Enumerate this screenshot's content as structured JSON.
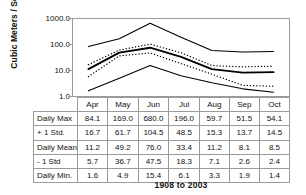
{
  "chart_data": {
    "type": "line",
    "title": "",
    "subtitle": "",
    "footer": "1908 to 2003",
    "xlabel": "",
    "ylabel": "Cubic Meters / Second",
    "yscale": "log",
    "ylim": [
      1.0,
      1000.0
    ],
    "ytick_labels": [
      "1000.0",
      "100.0",
      "10.0",
      "1.0"
    ],
    "ytick_values": [
      1000.0,
      100.0,
      10.0,
      1.0
    ],
    "grid": false,
    "legend": "none",
    "categories": [
      "Apr",
      "May",
      "Jun",
      "Jul",
      "Aug",
      "Sep",
      "Oct"
    ],
    "series": [
      {
        "name": "Daily Max",
        "style": "solid",
        "values": [
          84.1,
          169.0,
          680.0,
          196.0,
          59.7,
          51.5,
          54.1
        ]
      },
      {
        "name": "+ 1 Std.",
        "style": "dotted",
        "values": [
          16.7,
          61.7,
          104.5,
          48.5,
          15.3,
          13.7,
          14.5
        ]
      },
      {
        "name": "Daily Mean",
        "style": "solid-thick",
        "values": [
          11.2,
          49.2,
          76.0,
          33.4,
          11.2,
          8.1,
          8.5
        ]
      },
      {
        "name": "- 1 Std",
        "style": "dotted",
        "values": [
          5.7,
          36.7,
          47.5,
          18.3,
          7.1,
          2.6,
          2.4
        ]
      },
      {
        "name": "Daily Min.",
        "style": "solid",
        "values": [
          1.6,
          4.9,
          15.4,
          6.1,
          3.3,
          1.9,
          1.4
        ]
      }
    ]
  },
  "table": {
    "months": [
      "Apr",
      "May",
      "Jun",
      "Jul",
      "Aug",
      "Sep",
      "Oct"
    ],
    "rows": [
      {
        "label": "Daily Max",
        "values": [
          "84.1",
          "169.0",
          "680.0",
          "196.0",
          "59.7",
          "51.5",
          "54.1"
        ]
      },
      {
        "label": "+ 1 Std.",
        "values": [
          "16.7",
          "61.7",
          "104.5",
          "48.5",
          "15.3",
          "13.7",
          "14.5"
        ]
      },
      {
        "label": "Daily Mean",
        "values": [
          "11.2",
          "49.2",
          "76.0",
          "33.4",
          "11.2",
          "8.1",
          "8.5"
        ]
      },
      {
        "label": "- 1 Std",
        "values": [
          "5.7",
          "36.7",
          "47.5",
          "18.3",
          "7.1",
          "2.6",
          "2.4"
        ]
      },
      {
        "label": "Daily Min.",
        "values": [
          "1.6",
          "4.9",
          "15.4",
          "6.1",
          "3.3",
          "1.9",
          "1.4"
        ]
      }
    ]
  },
  "axis": {
    "y_title": "Cubic Meters / Second",
    "y_ticks": [
      "1000.0",
      "100.0",
      "10.0",
      "1.0"
    ]
  },
  "footer": {
    "period": "1908 to 2003"
  },
  "colors": {
    "line": "#000000",
    "border": "#9a9a9a",
    "text": "#111111",
    "background": "#ffffff"
  }
}
